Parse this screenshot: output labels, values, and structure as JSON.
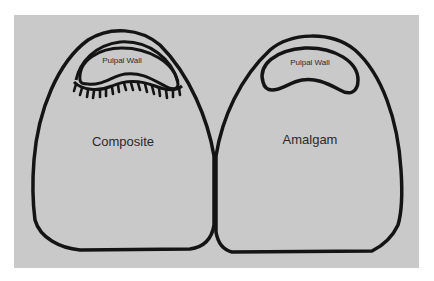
{
  "figure": {
    "background_color": "#c9c9c9",
    "stroke_color": "#141414",
    "teeth": [
      {
        "id": "left",
        "material_label": "Composite",
        "inner_label": "Pulpal Wall",
        "has_hybrid_layer_tags": true
      },
      {
        "id": "right",
        "material_label": "Amalgam",
        "inner_label": "Pulpal Wall",
        "has_hybrid_layer_tags": false
      }
    ]
  }
}
